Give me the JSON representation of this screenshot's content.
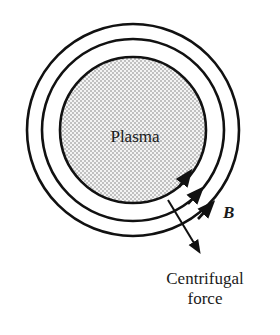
{
  "diagram": {
    "plasma_label": "Plasma",
    "field_label": "B",
    "force_label_line1": "Centrifugal",
    "force_label_line2": "force",
    "colors": {
      "stroke": "#111111",
      "dots": "#555555",
      "background": "#ffffff"
    }
  }
}
